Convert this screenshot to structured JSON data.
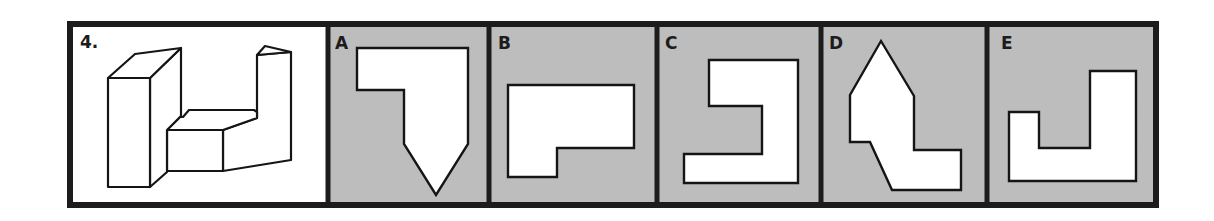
{
  "question": {
    "number_label": "4.",
    "figure": "3d-block-object"
  },
  "options": [
    {
      "label": "A",
      "shape": "pentagon-notched-arrow"
    },
    {
      "label": "B",
      "shape": "l-shape-horizontal"
    },
    {
      "label": "C",
      "shape": "bracket-shape"
    },
    {
      "label": "D",
      "shape": "house-with-step"
    },
    {
      "label": "E",
      "shape": "j-shape"
    }
  ],
  "colors": {
    "border": "#1c1c1c",
    "option_background": "#bdbdbd",
    "question_background": "#ffffff",
    "shape_fill": "#ffffff",
    "stroke": "#151515"
  }
}
